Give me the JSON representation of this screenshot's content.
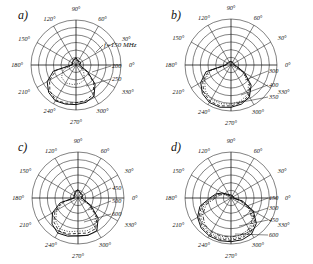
{
  "figure": {
    "title": "",
    "background": "#ffffff",
    "panel_count": 4
  },
  "panels": [
    {
      "id": "a",
      "letter": "a)",
      "angle_ticks": [
        "0°",
        "30°",
        "60°",
        "90°",
        "120°",
        "150°",
        "180°",
        "210°",
        "240°",
        "270°",
        "300°",
        "330°"
      ],
      "freq_label": "f=150 MHz",
      "curve_labels": [
        "200",
        "250"
      ],
      "rings": 6
    },
    {
      "id": "b",
      "letter": "b)",
      "angle_ticks": [
        "0°",
        "30°",
        "60°",
        "90°",
        "120°",
        "150°",
        "180°",
        "210°",
        "240°",
        "270°",
        "300°",
        "330°"
      ],
      "freq_label": "",
      "curve_labels": [
        "300",
        "400",
        "350"
      ],
      "rings": 6
    },
    {
      "id": "c",
      "letter": "c)",
      "angle_ticks": [
        "0°",
        "30°",
        "60°",
        "90°",
        "120°",
        "150°",
        "180°",
        "210°",
        "240°",
        "270°",
        "300°",
        "330°"
      ],
      "freq_label": "",
      "curve_labels": [
        "450",
        "500",
        "600"
      ],
      "rings": 6
    },
    {
      "id": "d",
      "letter": "d)",
      "angle_ticks": [
        "0°",
        "30°",
        "60°",
        "90°",
        "120°",
        "150°",
        "180°",
        "210°",
        "240°",
        "270°",
        "300°",
        "330°"
      ],
      "freq_label": "",
      "curve_labels": [
        "150",
        "300",
        "450",
        "600"
      ],
      "rings": 6
    }
  ],
  "chart_data": {
    "type": "line",
    "subtype": "polar-radiation-pattern",
    "title": "",
    "xlabel": "",
    "ylabel": "",
    "grid": true,
    "legend_position": "right-inline-leader-labels",
    "angle_unit": "degrees",
    "angle_ticks": [
      0,
      30,
      60,
      90,
      120,
      150,
      180,
      210,
      240,
      270,
      300,
      330
    ],
    "radial_rings": 6,
    "rlim": [
      0,
      1
    ],
    "panels": [
      {
        "id": "a",
        "letter": "a)",
        "annotation": "f=150 MHz",
        "series": [
          {
            "name": "200",
            "style": "solid",
            "theta": [
              180,
              195,
              210,
              225,
              240,
              255,
              270,
              285,
              300,
              315,
              330,
              345,
              360,
              15,
              30,
              45,
              60,
              75,
              90,
              105,
              120,
              135,
              150,
              165,
              180
            ],
            "r": [
              0.1,
              0.52,
              0.74,
              0.86,
              0.92,
              0.9,
              0.88,
              0.86,
              0.8,
              0.6,
              0.3,
              0.12,
              0.08,
              0.1,
              0.12,
              0.11,
              0.1,
              0.12,
              0.16,
              0.14,
              0.12,
              0.11,
              0.1,
              0.09,
              0.1
            ]
          },
          {
            "name": "250",
            "style": "dashed",
            "theta": [
              180,
              195,
              210,
              225,
              240,
              255,
              270,
              285,
              300,
              315,
              330,
              345,
              360,
              15,
              30,
              45,
              60,
              75,
              90,
              105,
              120,
              135,
              150,
              165,
              180
            ],
            "r": [
              0.09,
              0.46,
              0.68,
              0.82,
              0.9,
              0.88,
              0.84,
              0.82,
              0.76,
              0.56,
              0.27,
              0.11,
              0.07,
              0.09,
              0.11,
              0.1,
              0.09,
              0.11,
              0.15,
              0.13,
              0.11,
              0.1,
              0.09,
              0.08,
              0.09
            ]
          },
          {
            "name": "inner",
            "style": "dotted",
            "theta": [
              180,
              200,
              220,
              240,
              260,
              280,
              300,
              320,
              340,
              360,
              20,
              40,
              60,
              80,
              100,
              120,
              140,
              160,
              180
            ],
            "r": [
              0.08,
              0.3,
              0.42,
              0.46,
              0.44,
              0.42,
              0.38,
              0.22,
              0.1,
              0.06,
              0.08,
              0.09,
              0.08,
              0.1,
              0.13,
              0.1,
              0.09,
              0.08,
              0.08
            ]
          }
        ]
      },
      {
        "id": "b",
        "letter": "b)",
        "annotation": "",
        "series": [
          {
            "name": "300",
            "style": "solid",
            "theta": [
              180,
              195,
              210,
              225,
              240,
              255,
              270,
              285,
              300,
              315,
              330,
              345,
              360,
              15,
              30,
              45,
              60,
              75,
              90,
              105,
              120,
              135,
              150,
              165,
              180
            ],
            "r": [
              0.12,
              0.56,
              0.76,
              0.88,
              0.94,
              0.95,
              0.92,
              0.88,
              0.8,
              0.62,
              0.34,
              0.14,
              0.07,
              0.07,
              0.07,
              0.07,
              0.07,
              0.07,
              0.08,
              0.08,
              0.08,
              0.08,
              0.09,
              0.1,
              0.12
            ]
          },
          {
            "name": "400",
            "style": "dashed",
            "theta": [
              180,
              195,
              210,
              225,
              240,
              255,
              270,
              285,
              300,
              315,
              330,
              345,
              360,
              15,
              30,
              45,
              60,
              75,
              90,
              105,
              120,
              135,
              150,
              165,
              180
            ],
            "r": [
              0.11,
              0.5,
              0.71,
              0.84,
              0.91,
              0.92,
              0.89,
              0.85,
              0.77,
              0.58,
              0.31,
              0.12,
              0.06,
              0.06,
              0.06,
              0.06,
              0.06,
              0.06,
              0.07,
              0.07,
              0.07,
              0.07,
              0.08,
              0.09,
              0.11
            ]
          },
          {
            "name": "350",
            "style": "dotted",
            "theta": [
              180,
              195,
              210,
              225,
              240,
              255,
              270,
              285,
              300,
              315,
              330,
              345,
              360,
              15,
              30,
              45,
              60,
              75,
              90,
              105,
              120,
              135,
              150,
              165,
              180
            ],
            "r": [
              0.1,
              0.46,
              0.66,
              0.79,
              0.86,
              0.87,
              0.85,
              0.81,
              0.73,
              0.54,
              0.28,
              0.11,
              0.05,
              0.05,
              0.05,
              0.05,
              0.05,
              0.05,
              0.06,
              0.06,
              0.06,
              0.06,
              0.07,
              0.08,
              0.1
            ]
          }
        ]
      },
      {
        "id": "c",
        "letter": "c)",
        "annotation": "",
        "series": [
          {
            "name": "450",
            "style": "solid",
            "theta": [
              180,
              195,
              210,
              225,
              240,
              255,
              270,
              285,
              300,
              315,
              330,
              345,
              360,
              15,
              30,
              45,
              60,
              75,
              90,
              105,
              120,
              135,
              150,
              165,
              180
            ],
            "r": [
              0.09,
              0.4,
              0.64,
              0.8,
              0.88,
              0.86,
              0.82,
              0.84,
              0.82,
              0.62,
              0.32,
              0.13,
              0.08,
              0.1,
              0.12,
              0.12,
              0.12,
              0.14,
              0.18,
              0.16,
              0.13,
              0.11,
              0.1,
              0.09,
              0.09
            ]
          },
          {
            "name": "500",
            "style": "dashed",
            "theta": [
              180,
              195,
              210,
              225,
              240,
              255,
              270,
              285,
              300,
              315,
              330,
              345,
              360,
              15,
              30,
              45,
              60,
              75,
              90,
              105,
              120,
              135,
              150,
              165,
              180
            ],
            "r": [
              0.08,
              0.36,
              0.58,
              0.74,
              0.83,
              0.81,
              0.77,
              0.79,
              0.77,
              0.58,
              0.29,
              0.12,
              0.07,
              0.09,
              0.11,
              0.11,
              0.11,
              0.13,
              0.17,
              0.15,
              0.12,
              0.1,
              0.09,
              0.08,
              0.08
            ]
          },
          {
            "name": "600",
            "style": "dotted",
            "theta": [
              180,
              195,
              210,
              225,
              240,
              255,
              270,
              285,
              300,
              315,
              330,
              345,
              360,
              15,
              30,
              45,
              60,
              75,
              90,
              105,
              120,
              135,
              150,
              165,
              180
            ],
            "r": [
              0.07,
              0.32,
              0.53,
              0.69,
              0.78,
              0.76,
              0.72,
              0.74,
              0.72,
              0.54,
              0.26,
              0.11,
              0.06,
              0.08,
              0.1,
              0.1,
              0.1,
              0.12,
              0.16,
              0.14,
              0.11,
              0.09,
              0.08,
              0.07,
              0.07
            ]
          }
        ]
      },
      {
        "id": "d",
        "letter": "d)",
        "annotation": "",
        "series": [
          {
            "name": "150",
            "style": "solid",
            "theta": [
              180,
              195,
              210,
              225,
              240,
              255,
              270,
              285,
              300,
              315,
              330,
              345,
              360,
              15,
              30,
              45,
              60,
              75,
              90,
              105,
              120,
              135,
              150,
              165,
              180
            ],
            "r": [
              0.46,
              0.7,
              0.84,
              0.92,
              0.95,
              0.96,
              0.95,
              0.94,
              0.9,
              0.78,
              0.56,
              0.26,
              0.06,
              0.06,
              0.06,
              0.06,
              0.06,
              0.06,
              0.07,
              0.07,
              0.08,
              0.12,
              0.22,
              0.34,
              0.46
            ]
          },
          {
            "name": "300",
            "style": "dashed",
            "theta": [
              180,
              195,
              210,
              225,
              240,
              255,
              270,
              285,
              300,
              315,
              330,
              345,
              360,
              15,
              30,
              45,
              60,
              75,
              90,
              105,
              120,
              135,
              150,
              165,
              180
            ],
            "r": [
              0.42,
              0.66,
              0.8,
              0.89,
              0.92,
              0.93,
              0.92,
              0.9,
              0.86,
              0.74,
              0.52,
              0.24,
              0.05,
              0.05,
              0.05,
              0.05,
              0.05,
              0.05,
              0.06,
              0.06,
              0.07,
              0.11,
              0.2,
              0.31,
              0.42
            ]
          },
          {
            "name": "450",
            "style": "dotted",
            "theta": [
              180,
              195,
              210,
              225,
              240,
              255,
              270,
              285,
              300,
              315,
              330,
              345,
              360,
              15,
              30,
              45,
              60,
              75,
              90,
              105,
              120,
              135,
              150,
              165,
              180
            ],
            "r": [
              0.38,
              0.61,
              0.76,
              0.85,
              0.89,
              0.9,
              0.89,
              0.87,
              0.82,
              0.7,
              0.48,
              0.22,
              0.05,
              0.05,
              0.05,
              0.05,
              0.05,
              0.05,
              0.05,
              0.06,
              0.07,
              0.1,
              0.18,
              0.28,
              0.38
            ]
          },
          {
            "name": "600",
            "style": "dashdot",
            "theta": [
              180,
              195,
              210,
              225,
              240,
              255,
              270,
              285,
              300,
              315,
              330,
              345,
              360,
              15,
              30,
              45,
              60,
              75,
              90,
              105,
              120,
              135,
              150,
              165,
              180
            ],
            "r": [
              0.34,
              0.56,
              0.71,
              0.81,
              0.85,
              0.86,
              0.85,
              0.83,
              0.78,
              0.66,
              0.44,
              0.2,
              0.04,
              0.04,
              0.04,
              0.04,
              0.04,
              0.04,
              0.05,
              0.05,
              0.06,
              0.09,
              0.16,
              0.25,
              0.34
            ]
          }
        ]
      }
    ]
  }
}
